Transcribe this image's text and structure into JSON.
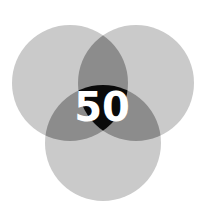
{
  "diagram": {
    "type": "venn",
    "sets": 3,
    "center_label": "50",
    "colors": {
      "single": "#c8c8c8",
      "pair": "#8a8a8a",
      "triple": "#0a0a0a",
      "label": "#ffffff",
      "background": "#ffffff"
    }
  }
}
